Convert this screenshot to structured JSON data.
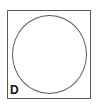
{
  "figure": {
    "panel_label": "D",
    "shape": "circle",
    "colors": {
      "frame": "#5a5a5a",
      "circle": "#5a5a5a",
      "label": "#111111",
      "background": "#ffffff"
    }
  }
}
